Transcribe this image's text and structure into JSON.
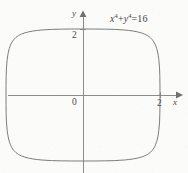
{
  "figure": {
    "title": "",
    "background_color": "#fbfbfa",
    "axis_color": "#8c8c8c",
    "curve_color": "#7d7d7d",
    "text_color": "#4a4a4a"
  },
  "equation": {
    "full": "x^4 + y^4 = 16",
    "x_var": "x",
    "x_exp": "4",
    "plus": "+",
    "y_var": "y",
    "y_exp": "4",
    "equals": "=",
    "rhs": "16"
  },
  "axes": {
    "x_label": "x",
    "y_label": "y",
    "origin_label": "0"
  },
  "ticks": {
    "y_tick_label": "2",
    "x_tick_label": "2"
  },
  "chart_data": {
    "type": "line",
    "title": "",
    "subtitle": "",
    "xlabel": "x",
    "ylabel": "y",
    "annotations": [
      "x^4 + y^4 = 16"
    ],
    "legend": [],
    "legend_position": "none",
    "grid": false,
    "xlim": [
      -2.55,
      3.1
    ],
    "ylim": [
      -2.6,
      2.6
    ],
    "xticks": [
      2
    ],
    "xticklabels": [
      "2"
    ],
    "yticks": [
      2
    ],
    "yticklabels": [
      "2"
    ],
    "origin_label": "0",
    "equation": "x^4 + y^4 = 16",
    "curve_description": "Closed squircle-shaped level curve of x^4 + y^4 = 16, intercepting both axes at +/-2 with nearly straight sides and rounded corners.",
    "series": [
      {
        "name": "x^4 + y^4 = 16",
        "closed": true,
        "x": [
          2.0,
          1.999,
          1.996,
          1.988,
          1.97,
          1.938,
          1.884,
          1.8,
          1.677,
          1.51,
          1.303,
          1.069,
          0.822,
          0.565,
          0.291,
          0.0,
          -0.291,
          -0.565,
          -0.822,
          -1.069,
          -1.303,
          -1.51,
          -1.677,
          -1.8,
          -1.884,
          -1.938,
          -1.97,
          -1.988,
          -1.996,
          -1.999,
          -2.0,
          -1.999,
          -1.996,
          -1.988,
          -1.97,
          -1.938,
          -1.884,
          -1.8,
          -1.677,
          -1.51,
          -1.303,
          -1.069,
          -0.822,
          -0.565,
          -0.291,
          0.0,
          0.291,
          0.565,
          0.822,
          1.069,
          1.303,
          1.51,
          1.677,
          1.8,
          1.884,
          1.938,
          1.97,
          1.988,
          1.996,
          1.999,
          2.0
        ],
        "y": [
          0.0,
          0.291,
          0.565,
          0.822,
          1.069,
          1.303,
          1.51,
          1.677,
          1.8,
          1.884,
          1.938,
          1.97,
          1.988,
          1.996,
          1.999,
          2.0,
          1.999,
          1.996,
          1.988,
          1.97,
          1.938,
          1.884,
          1.8,
          1.677,
          1.51,
          1.303,
          1.069,
          0.822,
          0.565,
          0.291,
          0.0,
          -0.291,
          -0.565,
          -0.822,
          -1.069,
          -1.303,
          -1.51,
          -1.677,
          -1.8,
          -1.884,
          -1.938,
          -1.97,
          -1.988,
          -1.996,
          -1.999,
          -2.0,
          -1.999,
          -1.996,
          -1.988,
          -1.97,
          -1.938,
          -1.884,
          -1.8,
          -1.677,
          -1.51,
          -1.303,
          -1.069,
          -0.822,
          -0.565,
          -0.291,
          0.0
        ],
        "color": "#7d7d7d",
        "linewidth": 1
      }
    ]
  }
}
